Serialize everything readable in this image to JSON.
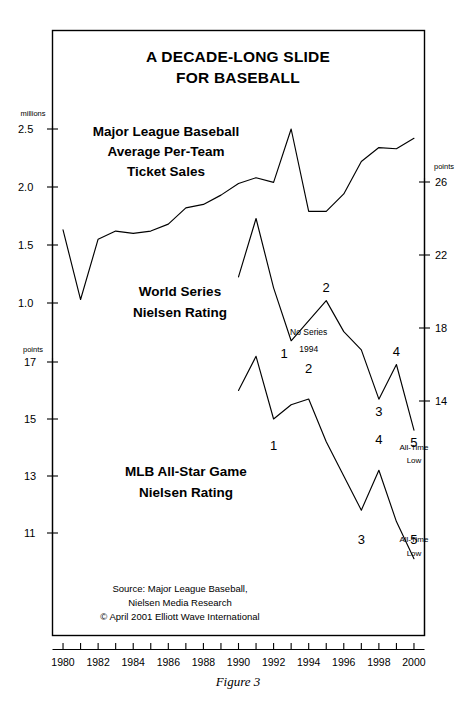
{
  "chart_data": {
    "type": "line",
    "title": "A DECADE-LONG SLIDE FOR BASEBALL",
    "title_lines": [
      "A DECADE-LONG SLIDE",
      "FOR BASEBALL"
    ],
    "caption": "Figure 3",
    "xlabel": "",
    "x": [
      1980,
      1981,
      1982,
      1983,
      1984,
      1985,
      1986,
      1987,
      1988,
      1989,
      1990,
      1991,
      1992,
      1993,
      1994,
      1995,
      1996,
      1997,
      1998,
      1999,
      2000
    ],
    "xlim": [
      1979.4,
      2000.6
    ],
    "xticks_major": [
      1980,
      1982,
      1984,
      1986,
      1988,
      1990,
      1992,
      1994,
      1996,
      1998,
      2000
    ],
    "xticks_all": [
      1980,
      1981,
      1982,
      1983,
      1984,
      1985,
      1986,
      1987,
      1988,
      1989,
      1990,
      1991,
      1992,
      1993,
      1994,
      1995,
      1996,
      1997,
      1998,
      1999,
      2000
    ],
    "grid": false,
    "legend_position": "inline-labels",
    "axes": [
      {
        "id": "left-top",
        "side": "left",
        "unit": "millions",
        "ticks": [
          2.5,
          2.0,
          1.5,
          1.0
        ],
        "tick_labels": [
          "2.5",
          "2.0",
          "1.5",
          "1.0"
        ],
        "ylim": [
          0.85,
          2.62
        ]
      },
      {
        "id": "left-bottom",
        "side": "left",
        "unit": "points",
        "ticks": [
          17,
          15,
          13,
          11
        ],
        "tick_labels": [
          "17",
          "15",
          "13",
          "11"
        ],
        "ylim": [
          9.9,
          17.9
        ]
      },
      {
        "id": "right",
        "side": "right",
        "unit": "points",
        "ticks": [
          26,
          22,
          18,
          14
        ],
        "tick_labels": [
          "26",
          "22",
          "18",
          "14"
        ],
        "ylim": [
          11.7,
          28.2
        ]
      }
    ],
    "series": [
      {
        "name": "Major League Baseball Average Per-Team Ticket Sales",
        "label_lines": [
          "Major League Baseball",
          "Average Per-Team",
          "Ticket Sales"
        ],
        "axis": "left-top",
        "unit": "millions",
        "values": [
          1.63,
          1.03,
          1.55,
          1.62,
          1.6,
          1.62,
          1.68,
          1.82,
          1.85,
          1.93,
          2.03,
          2.08,
          2.04,
          2.5,
          1.79,
          1.79,
          1.94,
          2.22,
          2.34,
          2.33,
          2.42
        ]
      },
      {
        "name": "World Series Nielsen Rating",
        "label_lines": [
          "World Series",
          "Nielsen Rating"
        ],
        "axis": "right",
        "unit": "points",
        "values": [
          null,
          null,
          null,
          null,
          null,
          null,
          null,
          null,
          null,
          null,
          20.8,
          24.0,
          20.2,
          17.3,
          null,
          19.5,
          17.8,
          16.8,
          14.1,
          16.0,
          12.4
        ],
        "wave_labels": [
          {
            "text": "1",
            "x": 1993,
            "value": 17.3,
            "position": "below-left"
          },
          {
            "text": "2",
            "x": 1995,
            "value": 19.5,
            "position": "above"
          },
          {
            "text": "3",
            "x": 1998,
            "value": 14.1,
            "position": "below"
          },
          {
            "text": "4",
            "x": 1999,
            "value": 16.0,
            "position": "above"
          },
          {
            "text": "5",
            "x": 2000,
            "value": 12.4,
            "position": "below"
          }
        ],
        "annotations": [
          {
            "text": "No Series",
            "x": 1994,
            "value": 17.6
          },
          {
            "text": "1994",
            "x": 1994,
            "value": 16.7
          },
          {
            "text": "All-Time",
            "x": 2000,
            "value": 11.3
          },
          {
            "text": "Low",
            "x": 2000,
            "value": 10.6
          }
        ]
      },
      {
        "name": "MLB All-Star Game Nielsen Rating",
        "label_lines": [
          "MLB All-Star Game",
          "Nielsen Rating"
        ],
        "axis": "left-bottom",
        "unit": "points",
        "values": [
          null,
          null,
          null,
          null,
          null,
          null,
          null,
          null,
          null,
          null,
          16.0,
          17.2,
          15.0,
          15.5,
          15.7,
          14.2,
          13.0,
          11.8,
          13.2,
          11.4,
          10.1
        ],
        "wave_labels": [
          {
            "text": "1",
            "x": 1992,
            "value": 14.5,
            "position": "below"
          },
          {
            "text": "2",
            "x": 1994,
            "value": 16.3,
            "position": "above"
          },
          {
            "text": "3",
            "x": 1997,
            "value": 11.2,
            "position": "below"
          },
          {
            "text": "4",
            "x": 1998,
            "value": 13.8,
            "position": "above"
          },
          {
            "text": "5",
            "x": 2000,
            "value": 11.2,
            "position": "below"
          }
        ],
        "annotations": [
          {
            "text": "All-Time",
            "x": 2000,
            "value": 10.7
          },
          {
            "text": "Low",
            "x": 2000,
            "value": 10.2
          }
        ]
      }
    ],
    "source_lines": [
      "Source: Major League Baseball,",
      "Nielsen Media Research",
      "© April 2001 Elliott Wave International"
    ],
    "colors": {
      "line": "#000000",
      "frame": "#000000",
      "background": "#ffffff",
      "text": "#000000"
    }
  }
}
